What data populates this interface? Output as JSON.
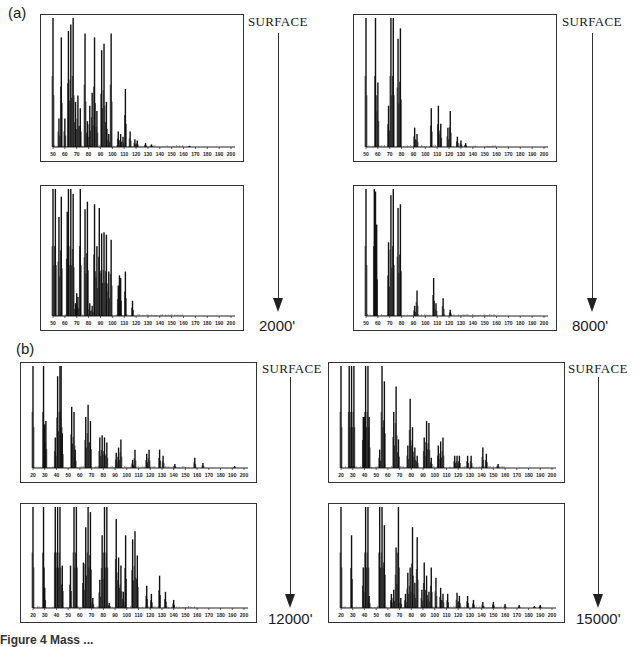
{
  "figure": {
    "caption_partial": "Figure 4 Mass ...",
    "panels": [
      {
        "id": "a",
        "label": "(a)",
        "top_label": "SURFACE"
      },
      {
        "id": "b",
        "label": "(b)",
        "top_label": "SURFACE"
      }
    ],
    "depth_labels": {
      "a_left": "2000'",
      "a_right": "8000'",
      "b_left": "12000'",
      "b_right": "15000'"
    },
    "surface_labels": {
      "a_left": "SURFACE",
      "a_right": "SURFACE",
      "b_left": "SURFACE",
      "b_right": "SURFACE"
    }
  },
  "chart_data": [
    {
      "type": "bar",
      "title": "(a) SURFACE, well 1 - surface sample",
      "xlabel": "m/z",
      "ylabel": "relative abundance",
      "xlim": [
        50,
        200
      ],
      "ylim": [
        0,
        100
      ],
      "grid": false,
      "xticks": [
        50,
        60,
        70,
        80,
        90,
        100,
        110,
        120,
        130,
        140,
        150,
        160,
        170,
        180,
        190,
        200
      ],
      "x": [
        50,
        55,
        57,
        60,
        63,
        65,
        67,
        69,
        71,
        73,
        77,
        79,
        81,
        83,
        85,
        87,
        91,
        93,
        95,
        97,
        99,
        105,
        107,
        109,
        111,
        115,
        119,
        121,
        128,
        133,
        165
      ],
      "values": [
        100,
        22,
        85,
        22,
        90,
        95,
        100,
        35,
        40,
        30,
        88,
        20,
        32,
        42,
        85,
        28,
        75,
        80,
        35,
        10,
        88,
        12,
        10,
        8,
        45,
        12,
        6,
        5,
        3,
        2,
        1
      ]
    },
    {
      "type": "bar",
      "title": "(a) 2000'",
      "xlabel": "m/z",
      "ylabel": "relative abundance",
      "xlim": [
        50,
        200
      ],
      "ylim": [
        0,
        100
      ],
      "grid": false,
      "xticks": [
        50,
        60,
        70,
        80,
        90,
        100,
        110,
        120,
        130,
        140,
        150,
        160,
        170,
        180,
        190,
        200
      ],
      "x": [
        50,
        52,
        55,
        57,
        62,
        63,
        65,
        67,
        69,
        70,
        71,
        73,
        77,
        79,
        81,
        83,
        85,
        87,
        89,
        91,
        93,
        95,
        97,
        99,
        105,
        106,
        107,
        111,
        117
      ],
      "values": [
        100,
        100,
        78,
        94,
        82,
        100,
        100,
        96,
        10,
        18,
        15,
        100,
        84,
        90,
        10,
        8,
        88,
        55,
        85,
        65,
        66,
        64,
        35,
        60,
        24,
        32,
        30,
        35,
        12
      ]
    },
    {
      "type": "bar",
      "title": "(a) SURFACE, well 2 - surface sample",
      "xlabel": "m/z",
      "ylabel": "relative abundance",
      "xlim": [
        50,
        200
      ],
      "ylim": [
        0,
        100
      ],
      "grid": false,
      "xticks": [
        50,
        60,
        70,
        80,
        90,
        100,
        110,
        120,
        130,
        140,
        150,
        160,
        170,
        180,
        190,
        200
      ],
      "x": [
        50,
        58,
        60,
        69,
        71,
        73,
        77,
        79,
        91,
        93,
        105,
        111,
        113,
        119,
        121,
        127,
        130,
        134
      ],
      "values": [
        100,
        100,
        50,
        32,
        100,
        100,
        84,
        92,
        15,
        10,
        30,
        32,
        18,
        15,
        28,
        8,
        5,
        3
      ]
    },
    {
      "type": "bar",
      "title": "(a) 8000'",
      "xlabel": "m/z",
      "ylabel": "relative abundance",
      "xlim": [
        50,
        200
      ],
      "ylim": [
        0,
        100
      ],
      "grid": false,
      "xticks": [
        50,
        60,
        70,
        80,
        90,
        100,
        110,
        120,
        130,
        140,
        150,
        160,
        170,
        180,
        190,
        200
      ],
      "x": [
        50,
        57,
        58,
        59,
        69,
        71,
        73,
        77,
        79,
        91,
        93,
        107,
        109,
        115,
        121
      ],
      "values": [
        100,
        100,
        98,
        72,
        58,
        95,
        100,
        85,
        88,
        8,
        20,
        30,
        10,
        14,
        5
      ]
    },
    {
      "type": "bar",
      "title": "(b) SURFACE, well 3 - surface sample",
      "xlabel": "m/z",
      "ylabel": "relative abundance",
      "xlim": [
        20,
        200
      ],
      "ylim": [
        0,
        100
      ],
      "grid": false,
      "xticks": [
        20,
        30,
        40,
        50,
        60,
        70,
        80,
        90,
        100,
        110,
        120,
        130,
        140,
        150,
        160,
        170,
        180,
        190,
        200
      ],
      "x": [
        20,
        29,
        30,
        31,
        39,
        41,
        43,
        44,
        45,
        53,
        55,
        56,
        65,
        67,
        69,
        77,
        79,
        81,
        83,
        91,
        93,
        95,
        105,
        107,
        117,
        119,
        128,
        131,
        141,
        158,
        165,
        192
      ],
      "values": [
        100,
        100,
        43,
        46,
        30,
        90,
        100,
        100,
        34,
        60,
        55,
        18,
        50,
        62,
        46,
        30,
        32,
        30,
        25,
        15,
        20,
        28,
        8,
        18,
        14,
        18,
        18,
        12,
        4,
        10,
        5,
        2
      ]
    },
    {
      "type": "bar",
      "title": "(b) 12000'",
      "xlabel": "m/z",
      "ylabel": "relative abundance",
      "xlim": [
        20,
        200
      ],
      "ylim": [
        0,
        100
      ],
      "grid": false,
      "xticks": [
        20,
        30,
        40,
        50,
        60,
        70,
        80,
        90,
        100,
        110,
        120,
        130,
        140,
        150,
        160,
        170,
        180,
        190,
        200
      ],
      "x": [
        20,
        29,
        30,
        39,
        41,
        43,
        45,
        52,
        55,
        57,
        63,
        65,
        67,
        69,
        71,
        77,
        79,
        81,
        83,
        85,
        91,
        93,
        95,
        97,
        99,
        105,
        107,
        109,
        117,
        121,
        128,
        133,
        140
      ],
      "values": [
        100,
        100,
        20,
        100,
        100,
        100,
        42,
        42,
        100,
        100,
        45,
        80,
        100,
        95,
        10,
        28,
        72,
        100,
        100,
        5,
        88,
        50,
        42,
        16,
        72,
        68,
        76,
        52,
        22,
        14,
        32,
        16,
        8
      ]
    },
    {
      "type": "bar",
      "title": "(b) SURFACE, well 4 - surface sample",
      "xlabel": "m/z",
      "ylabel": "relative abundance",
      "xlim": [
        20,
        200
      ],
      "ylim": [
        0,
        100
      ],
      "grid": false,
      "xticks": [
        20,
        30,
        40,
        50,
        60,
        70,
        80,
        90,
        100,
        110,
        120,
        130,
        140,
        150,
        160,
        170,
        180,
        190,
        200
      ],
      "x": [
        20,
        27,
        29,
        31,
        39,
        40,
        41,
        43,
        44,
        53,
        55,
        57,
        65,
        67,
        69,
        77,
        79,
        81,
        83,
        85,
        91,
        93,
        95,
        97,
        103,
        105,
        107,
        117,
        119,
        121,
        128,
        131,
        141,
        144,
        154
      ],
      "values": [
        100,
        100,
        100,
        100,
        50,
        50,
        100,
        100,
        50,
        18,
        100,
        85,
        55,
        80,
        28,
        22,
        68,
        40,
        20,
        12,
        30,
        46,
        44,
        10,
        22,
        26,
        30,
        12,
        12,
        12,
        12,
        12,
        20,
        14,
        4
      ]
    },
    {
      "type": "bar",
      "title": "(b) 15000'",
      "xlabel": "m/z",
      "ylabel": "relative abundance",
      "xlim": [
        20,
        200
      ],
      "ylim": [
        0,
        100
      ],
      "grid": false,
      "xticks": [
        20,
        30,
        40,
        50,
        60,
        70,
        80,
        90,
        100,
        110,
        120,
        130,
        140,
        150,
        160,
        170,
        180,
        190,
        200
      ],
      "x": [
        20,
        29,
        39,
        41,
        43,
        44,
        53,
        55,
        57,
        63,
        65,
        67,
        69,
        71,
        75,
        77,
        79,
        81,
        83,
        85,
        89,
        91,
        93,
        95,
        97,
        101,
        105,
        107,
        111,
        119,
        121,
        128,
        133,
        141,
        150,
        160,
        172,
        185,
        190
      ],
      "values": [
        100,
        72,
        40,
        100,
        100,
        12,
        100,
        100,
        82,
        14,
        18,
        60,
        100,
        10,
        14,
        35,
        40,
        80,
        25,
        70,
        18,
        45,
        32,
        16,
        40,
        30,
        20,
        14,
        14,
        15,
        12,
        12,
        8,
        6,
        6,
        4,
        3,
        2,
        3
      ]
    }
  ]
}
